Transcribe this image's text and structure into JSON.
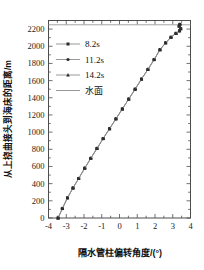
{
  "chart_data": {
    "type": "line",
    "title": "",
    "xlabel": "隔水管柱偏转角度/(°)",
    "ylabel": "从上挠曲接头到海床的距离/m",
    "xlim": [
      -4,
      4
    ],
    "ylim": [
      0,
      2300
    ],
    "xticks": [
      -4,
      -3,
      -2,
      -1,
      0,
      1,
      2,
      3,
      4
    ],
    "xticklabels": [
      "-4",
      "-3",
      "-2",
      "-1",
      "0",
      "1",
      "2",
      "3",
      "4"
    ],
    "yticks": [
      0,
      200,
      400,
      600,
      800,
      1000,
      1200,
      1400,
      1600,
      1800,
      2000,
      2200
    ],
    "yticklabels": [
      "0",
      "200",
      "400",
      "600",
      "800",
      "1000",
      "1200",
      "1400",
      "1600",
      "1800",
      "2000",
      "2200"
    ],
    "grid": false,
    "legend_position": "upper-left",
    "orientation": "y-is-depth",
    "series": [
      {
        "name": "8.2s",
        "marker": "square",
        "color": "#2b2b2b",
        "line_color": "#8c8c8c",
        "x": [
          -3.46,
          -3.22,
          -2.93,
          -2.62,
          -2.3,
          -1.96,
          -1.62,
          -1.27,
          -0.92,
          -0.56,
          -0.2,
          0.16,
          0.52,
          0.88,
          1.24,
          1.6,
          1.95,
          2.28,
          2.6,
          2.9,
          3.18,
          3.38,
          3.45,
          3.36,
          3.4
        ],
        "y": [
          0,
          110,
          235,
          350,
          460,
          580,
          695,
          810,
          925,
          1040,
          1155,
          1270,
          1385,
          1500,
          1618,
          1730,
          1845,
          1960,
          2040,
          2105,
          2150,
          2180,
          2205,
          2235,
          2255
        ]
      },
      {
        "name": "11.2s",
        "marker": "circle",
        "color": "#2b2b2b",
        "line_color": "#8c8c8c",
        "x": [
          -3.46,
          -3.22,
          -2.93,
          -2.62,
          -2.3,
          -1.96,
          -1.62,
          -1.27,
          -0.92,
          -0.56,
          -0.2,
          0.16,
          0.52,
          0.88,
          1.24,
          1.6,
          1.95,
          2.28,
          2.6,
          2.9,
          3.18,
          3.38,
          3.45,
          3.36,
          3.4
        ],
        "y": [
          0,
          110,
          235,
          350,
          460,
          580,
          695,
          810,
          925,
          1040,
          1155,
          1270,
          1385,
          1500,
          1618,
          1730,
          1845,
          1960,
          2040,
          2105,
          2150,
          2180,
          2205,
          2235,
          2255
        ]
      },
      {
        "name": "14.2s",
        "marker": "triangle",
        "color": "#2b2b2b",
        "line_color": "#8c8c8c",
        "x": [
          -3.46,
          -3.22,
          -2.93,
          -2.62,
          -2.3,
          -1.96,
          -1.62,
          -1.27,
          -0.92,
          -0.56,
          -0.2,
          0.16,
          0.52,
          0.88,
          1.24,
          1.6,
          1.95,
          2.28,
          2.6,
          2.9,
          3.18,
          3.38,
          3.45,
          3.36,
          3.4
        ],
        "y": [
          0,
          110,
          235,
          350,
          460,
          580,
          695,
          810,
          925,
          1040,
          1155,
          1270,
          1385,
          1500,
          1618,
          1730,
          1845,
          1960,
          2040,
          2105,
          2150,
          2180,
          2205,
          2235,
          2255
        ]
      }
    ],
    "reference_lines": [
      {
        "name": "水面",
        "orientation": "horizontal",
        "value": 2250,
        "color": "#9a9a9a"
      }
    ],
    "legend": [
      {
        "label": "8.2s",
        "marker": "square"
      },
      {
        "label": "11.2s",
        "marker": "circle"
      },
      {
        "label": "14.2s",
        "marker": "triangle"
      },
      {
        "label": "水面",
        "marker": "line"
      }
    ]
  }
}
